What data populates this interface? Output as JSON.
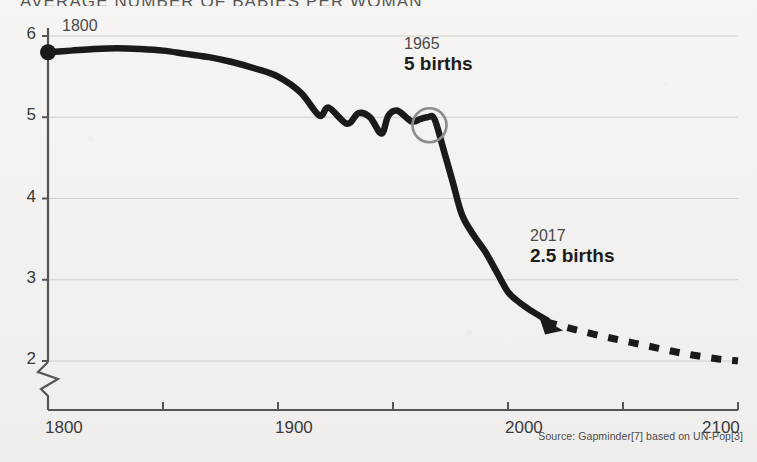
{
  "chart_data": {
    "type": "line",
    "title": "AVERAGE NUMBER OF BABIES PER WOMAN",
    "xlabel": "",
    "ylabel": "",
    "xlim": [
      1800,
      2100
    ],
    "ylim": [
      1.78,
      6.2
    ],
    "grid": true,
    "legend": null,
    "y_ticks": [
      "6",
      "5",
      "4",
      "3",
      "2"
    ],
    "y_tick_values": [
      6,
      5,
      4,
      3,
      2
    ],
    "x_ticks": [
      "1800",
      "1900",
      "2000",
      "2100"
    ],
    "x_tick_values": [
      1800,
      1900,
      2000,
      2100
    ],
    "x_minor_tick_values": [
      1850,
      1950,
      2050
    ],
    "axis_break": true,
    "axis_break_note": "y-axis broken between 2 and 0",
    "source": "Source: Gapminder[7] based on UN-Pop[3]",
    "series": [
      {
        "name": "Historical (observed)",
        "style": "solid",
        "color": "#1a1a1a",
        "x": [
          1800,
          1810,
          1820,
          1830,
          1840,
          1850,
          1860,
          1870,
          1880,
          1890,
          1900,
          1910,
          1918,
          1922,
          1930,
          1935,
          1940,
          1945,
          1948,
          1952,
          1958,
          1962,
          1965,
          1968,
          1972,
          1976,
          1980,
          1985,
          1990,
          1995,
          2000,
          2005,
          2010,
          2017
        ],
        "y": [
          5.8,
          5.82,
          5.84,
          5.85,
          5.84,
          5.82,
          5.78,
          5.74,
          5.68,
          5.6,
          5.5,
          5.3,
          5.02,
          5.12,
          4.92,
          5.05,
          5.0,
          4.8,
          5.02,
          5.08,
          4.95,
          4.98,
          5.0,
          4.98,
          4.6,
          4.2,
          3.8,
          3.55,
          3.35,
          3.1,
          2.85,
          2.72,
          2.62,
          2.5
        ]
      },
      {
        "name": "UN projection",
        "style": "dashed",
        "color": "#1a1a1a",
        "x": [
          2017,
          2030,
          2045,
          2060,
          2075,
          2090,
          2100
        ],
        "y": [
          2.48,
          2.38,
          2.28,
          2.19,
          2.1,
          2.03,
          2.0
        ]
      }
    ],
    "markers": [
      {
        "name": "start-dot",
        "x": 1800,
        "y": 5.8,
        "shape": "filled-circle"
      },
      {
        "name": "highlight-circle",
        "x": 1965,
        "y": 5.0,
        "shape": "open-circle"
      },
      {
        "name": "arrow-head",
        "x": 2017,
        "y": 2.5,
        "shape": "arrow"
      }
    ],
    "annotations": [
      {
        "name": "start-year",
        "label": "1800",
        "x": 1800,
        "y": 6.0
      },
      {
        "name": "peak-1965",
        "year": "1965",
        "value": "5 births",
        "x": 1965,
        "y": 5.6
      },
      {
        "name": "today-2017",
        "year": "2017",
        "value": "2.5 births",
        "x": 2017,
        "y": 3.1
      }
    ]
  },
  "axis": {
    "y_labels": [
      "6",
      "5",
      "4",
      "3",
      "2"
    ],
    "x_labels": [
      "1800",
      "1900",
      "2000",
      "2100"
    ]
  },
  "annotations": {
    "start_year": "1800",
    "mid_year": "1965",
    "mid_value": "5 births",
    "end_year": "2017",
    "end_value": "2.5 births"
  },
  "footer": {
    "source": "Source: Gapminder[7] based on UN-Pop[3]"
  },
  "colors": {
    "line": "#1a1a1a",
    "grid": "#cfcfcf",
    "axis": "#555555",
    "paper": "#f4f3f1",
    "text": "#2b2b2b"
  }
}
